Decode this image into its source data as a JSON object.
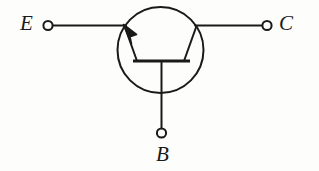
{
  "figure": {
    "background_color": "#fdfdfc",
    "stroke_color": "#1a1a1a"
  },
  "terminals": {
    "emitter": {
      "label": "E",
      "node_name": "emitter-terminal-node",
      "lead_name": "emitter-lead"
    },
    "collector": {
      "label": "C",
      "node_name": "collector-terminal-node",
      "lead_name": "collector-lead"
    },
    "base": {
      "label": "B",
      "node_name": "base-terminal-node",
      "lead_name": "base-lead"
    }
  },
  "symbol": {
    "envelope_name": "transistor-envelope-circle",
    "base_bar_name": "base-bar",
    "emitter_arrow_name": "emitter-arrow",
    "collector_slant_name": "collector-slant"
  }
}
